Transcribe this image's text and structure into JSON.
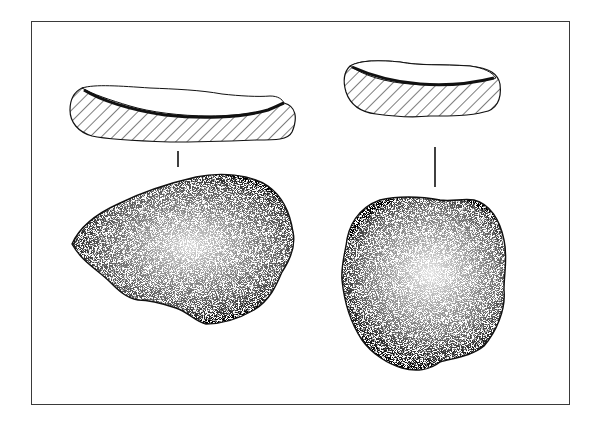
{
  "figure": {
    "type": "archaeological-illustration",
    "colors": {
      "ink": "#111111",
      "frame": "#3a3a3a",
      "background": "#ffffff"
    },
    "artifacts": [
      {
        "id": "left",
        "section_style": "diagonal-hatch",
        "plan_style": "stipple",
        "shape": "irregular-angular"
      },
      {
        "id": "right",
        "section_style": "diagonal-hatch",
        "plan_style": "stipple",
        "shape": "rounded-oval"
      }
    ]
  }
}
